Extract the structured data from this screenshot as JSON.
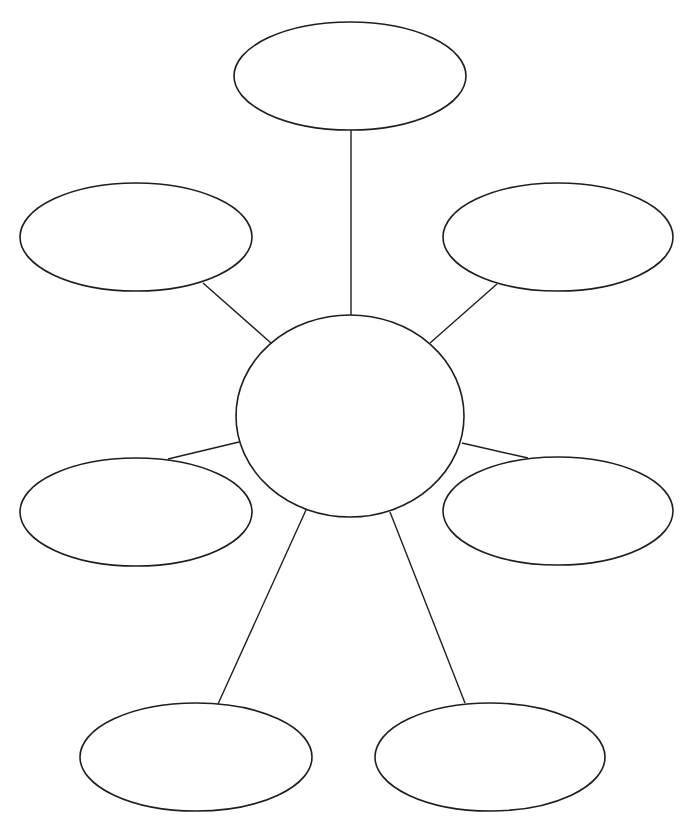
{
  "diagram": {
    "type": "bubble-map",
    "background": "#ffffff",
    "stroke_color": "#1e1e1e",
    "center": {
      "id": "center",
      "cx": 350,
      "cy": 416,
      "rx": 114,
      "ry": 101,
      "label": ""
    },
    "bubbles": [
      {
        "id": "top",
        "cx": 350,
        "cy": 76,
        "rx": 116,
        "ry": 54,
        "label": ""
      },
      {
        "id": "upper-left",
        "cx": 136,
        "cy": 237,
        "rx": 116,
        "ry": 54,
        "label": ""
      },
      {
        "id": "upper-right",
        "cx": 558,
        "cy": 237,
        "rx": 115,
        "ry": 54,
        "label": ""
      },
      {
        "id": "lower-left",
        "cx": 136,
        "cy": 512,
        "rx": 116,
        "ry": 54,
        "label": ""
      },
      {
        "id": "lower-right",
        "cx": 558,
        "cy": 511,
        "rx": 115,
        "ry": 54,
        "label": ""
      },
      {
        "id": "bottom-left",
        "cx": 196,
        "cy": 757,
        "rx": 116,
        "ry": 54,
        "label": ""
      },
      {
        "id": "bottom-right",
        "cx": 490,
        "cy": 757,
        "rx": 115,
        "ry": 54,
        "label": ""
      }
    ],
    "connectors": [
      {
        "to": "top",
        "x1": 351,
        "y1": 316,
        "x2": 351,
        "y2": 130
      },
      {
        "to": "upper-left",
        "x1": 271,
        "y1": 343,
        "x2": 203,
        "y2": 283
      },
      {
        "to": "upper-right",
        "x1": 430,
        "y1": 343,
        "x2": 497,
        "y2": 284
      },
      {
        "to": "lower-left",
        "x1": 239,
        "y1": 442,
        "x2": 168,
        "y2": 459
      },
      {
        "to": "lower-right",
        "x1": 462,
        "y1": 443,
        "x2": 528,
        "y2": 458
      },
      {
        "to": "bottom-left",
        "x1": 306,
        "y1": 510,
        "x2": 218,
        "y2": 704
      },
      {
        "to": "bottom-right",
        "x1": 390,
        "y1": 512,
        "x2": 465,
        "y2": 703
      }
    ]
  }
}
